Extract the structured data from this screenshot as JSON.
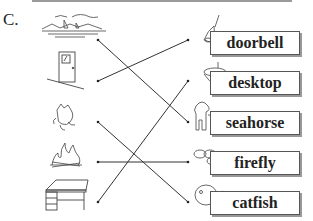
{
  "question_label": "C.",
  "left_pictures": [
    "sea",
    "door",
    "cat",
    "fire",
    "desk"
  ],
  "right_items": [
    {
      "picture": "bell",
      "word": "doorbell"
    },
    {
      "picture": "top",
      "word": "desktop"
    },
    {
      "picture": "horse",
      "word": "seahorse"
    },
    {
      "picture": "fly",
      "word": "firefly"
    },
    {
      "picture": "fish",
      "word": "catfish"
    }
  ],
  "connections": [
    {
      "from": "sea",
      "to": "seahorse"
    },
    {
      "from": "door",
      "to": "doorbell"
    },
    {
      "from": "cat",
      "to": "catfish"
    },
    {
      "from": "fire",
      "to": "firefly"
    },
    {
      "from": "desk",
      "to": "desktop"
    }
  ]
}
